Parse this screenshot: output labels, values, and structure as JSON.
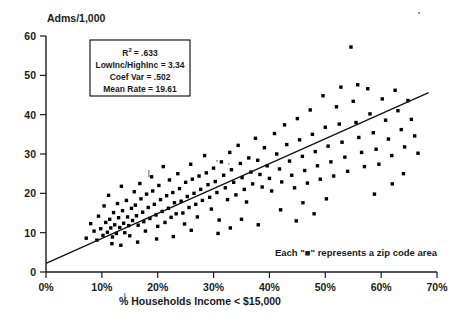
{
  "chart_data": {
    "type": "scatter",
    "title": "",
    "ylabel": "Adms/1,000",
    "xlabel": "% Households Income < $15,000",
    "xlim": [
      0,
      70
    ],
    "ylim": [
      0,
      60
    ],
    "grid": false,
    "legend_position": "none",
    "x_tick_labels": [
      "0%",
      "10%",
      "20%",
      "30%",
      "40%",
      "50%",
      "60%",
      "70%"
    ],
    "x_tick_values": [
      0,
      10,
      20,
      30,
      40,
      50,
      60,
      70
    ],
    "y_tick_labels": [
      "0",
      "10",
      "20",
      "30",
      "40",
      "50",
      "60"
    ],
    "y_tick_values": [
      0,
      10,
      20,
      30,
      40,
      50,
      60
    ],
    "annotation": "Each \"■\" represents a zip code area",
    "marker_shape": "square",
    "marker_color": "#000000",
    "trendline": {
      "type": "linear",
      "x_start": 0,
      "y_start": 2.2,
      "x_end": 68.5,
      "y_end": 45.6
    },
    "stats_box": {
      "r_squared_label": "R",
      "r_squared_exponent": "2",
      "r_squared_value": "= .633",
      "lines": [
        "LowInc/HighInc = 3.34",
        "Coef Var = .502",
        "Mean Rate = 19.61"
      ]
    },
    "series": [
      {
        "name": "Zip code areas",
        "points": [
          [
            7.2,
            8.6
          ],
          [
            8.0,
            12.3
          ],
          [
            8.6,
            10.4
          ],
          [
            9.1,
            8.1
          ],
          [
            9.4,
            14.2
          ],
          [
            9.8,
            11.0
          ],
          [
            10.2,
            9.3
          ],
          [
            10.4,
            16.8
          ],
          [
            10.7,
            12.6
          ],
          [
            11.0,
            10.1
          ],
          [
            11.2,
            19.5
          ],
          [
            11.4,
            13.4
          ],
          [
            11.6,
            11.2
          ],
          [
            11.9,
            8.9
          ],
          [
            12.1,
            15.1
          ],
          [
            12.3,
            12.0
          ],
          [
            12.6,
            9.8
          ],
          [
            12.8,
            17.4
          ],
          [
            13.0,
            13.8
          ],
          [
            13.2,
            11.3
          ],
          [
            13.5,
            21.8
          ],
          [
            13.7,
            15.6
          ],
          [
            13.9,
            12.4
          ],
          [
            14.1,
            10.0
          ],
          [
            14.4,
            18.2
          ],
          [
            14.6,
            14.0
          ],
          [
            14.8,
            11.8
          ],
          [
            15.0,
            9.2
          ],
          [
            15.3,
            16.2
          ],
          [
            15.5,
            13.1
          ],
          [
            15.8,
            20.4
          ],
          [
            16.0,
            17.0
          ],
          [
            16.2,
            14.3
          ],
          [
            16.5,
            11.9
          ],
          [
            16.8,
            22.5
          ],
          [
            17.0,
            18.6
          ],
          [
            17.3,
            15.2
          ],
          [
            17.5,
            12.8
          ],
          [
            17.8,
            10.4
          ],
          [
            18.0,
            19.8
          ],
          [
            18.3,
            16.4
          ],
          [
            18.6,
            13.6
          ],
          [
            18.9,
            24.2
          ],
          [
            19.1,
            20.6
          ],
          [
            19.4,
            17.2
          ],
          [
            19.7,
            14.5
          ],
          [
            20.0,
            11.6
          ],
          [
            20.2,
            22.0
          ],
          [
            20.5,
            18.4
          ],
          [
            20.8,
            15.4
          ],
          [
            21.0,
            26.8
          ],
          [
            21.3,
            12.6
          ],
          [
            21.6,
            19.4
          ],
          [
            21.9,
            16.2
          ],
          [
            22.1,
            23.4
          ],
          [
            22.4,
            13.9
          ],
          [
            22.7,
            20.2
          ],
          [
            23.0,
            17.6
          ],
          [
            23.3,
            14.8
          ],
          [
            23.6,
            25.0
          ],
          [
            23.9,
            21.2
          ],
          [
            24.2,
            18.0
          ],
          [
            24.5,
            15.0
          ],
          [
            24.8,
            12.2
          ],
          [
            25.0,
            22.8
          ],
          [
            25.3,
            19.2
          ],
          [
            25.6,
            16.4
          ],
          [
            25.9,
            27.4
          ],
          [
            26.2,
            23.6
          ],
          [
            26.5,
            20.0
          ],
          [
            26.8,
            17.2
          ],
          [
            27.1,
            14.0
          ],
          [
            27.4,
            24.4
          ],
          [
            27.7,
            21.0
          ],
          [
            28.0,
            18.2
          ],
          [
            28.4,
            29.6
          ],
          [
            28.7,
            25.2
          ],
          [
            29.0,
            22.2
          ],
          [
            29.3,
            19.0
          ],
          [
            29.6,
            16.0
          ],
          [
            30.0,
            26.4
          ],
          [
            30.3,
            23.0
          ],
          [
            30.6,
            20.2
          ],
          [
            31.0,
            13.2
          ],
          [
            31.4,
            28.0
          ],
          [
            31.8,
            24.6
          ],
          [
            32.1,
            21.4
          ],
          [
            32.5,
            18.4
          ],
          [
            32.9,
            30.4
          ],
          [
            33.2,
            26.0
          ],
          [
            33.6,
            22.8
          ],
          [
            34.0,
            19.6
          ],
          [
            34.4,
            32.2
          ],
          [
            34.8,
            27.6
          ],
          [
            35.1,
            24.0
          ],
          [
            35.5,
            21.0
          ],
          [
            35.9,
            17.8
          ],
          [
            36.3,
            29.0
          ],
          [
            36.7,
            25.4
          ],
          [
            37.0,
            22.4
          ],
          [
            37.5,
            34.0
          ],
          [
            37.9,
            28.4
          ],
          [
            38.3,
            24.8
          ],
          [
            38.7,
            21.6
          ],
          [
            39.1,
            31.6
          ],
          [
            39.6,
            27.0
          ],
          [
            40.0,
            23.8
          ],
          [
            40.4,
            20.6
          ],
          [
            40.9,
            35.2
          ],
          [
            41.3,
            30.0
          ],
          [
            41.8,
            26.2
          ],
          [
            42.2,
            22.9
          ],
          [
            42.7,
            37.4
          ],
          [
            43.1,
            32.4
          ],
          [
            43.6,
            28.2
          ],
          [
            44.0,
            24.6
          ],
          [
            44.5,
            21.4
          ],
          [
            45.0,
            39.0
          ],
          [
            45.4,
            33.6
          ],
          [
            45.9,
            29.4
          ],
          [
            46.3,
            25.8
          ],
          [
            46.8,
            22.6
          ],
          [
            47.3,
            41.2
          ],
          [
            47.7,
            35.0
          ],
          [
            48.2,
            30.6
          ],
          [
            48.6,
            27.0
          ],
          [
            49.1,
            23.6
          ],
          [
            49.6,
            44.8
          ],
          [
            50.0,
            36.8
          ],
          [
            50.5,
            32.0
          ],
          [
            51.0,
            28.0
          ],
          [
            51.5,
            24.4
          ],
          [
            52.0,
            42.0
          ],
          [
            52.5,
            37.6
          ],
          [
            53.0,
            33.0
          ],
          [
            53.5,
            29.2
          ],
          [
            54.0,
            25.6
          ],
          [
            54.6,
            57.2
          ],
          [
            55.0,
            43.4
          ],
          [
            55.5,
            38.0
          ],
          [
            56.0,
            34.2
          ],
          [
            56.5,
            30.4
          ],
          [
            57.0,
            26.8
          ],
          [
            57.6,
            46.6
          ],
          [
            58.0,
            40.2
          ],
          [
            58.6,
            35.4
          ],
          [
            59.1,
            31.2
          ],
          [
            59.6,
            27.4
          ],
          [
            60.2,
            44.0
          ],
          [
            60.8,
            38.6
          ],
          [
            61.3,
            33.8
          ],
          [
            61.9,
            29.6
          ],
          [
            62.5,
            46.2
          ],
          [
            63.0,
            41.0
          ],
          [
            63.6,
            36.2
          ],
          [
            64.2,
            31.8
          ],
          [
            64.8,
            43.6
          ],
          [
            65.4,
            38.8
          ],
          [
            66.0,
            34.6
          ],
          [
            66.6,
            30.2
          ],
          [
            52.8,
            47.0
          ],
          [
            55.8,
            47.6
          ],
          [
            50.2,
            18.6
          ],
          [
            62.0,
            22.4
          ],
          [
            35.0,
            13.4
          ],
          [
            42.0,
            15.8
          ],
          [
            46.0,
            17.6
          ],
          [
            38.0,
            12.0
          ],
          [
            44.8,
            13.0
          ],
          [
            33.0,
            11.2
          ],
          [
            48.0,
            14.8
          ],
          [
            58.8,
            19.8
          ],
          [
            64.0,
            25.0
          ],
          [
            30.8,
            9.8
          ],
          [
            26.0,
            10.6
          ],
          [
            19.8,
            8.4
          ],
          [
            22.8,
            9.0
          ],
          [
            16.4,
            7.6
          ],
          [
            13.4,
            6.8
          ],
          [
            11.8,
            7.2
          ]
        ]
      }
    ]
  }
}
